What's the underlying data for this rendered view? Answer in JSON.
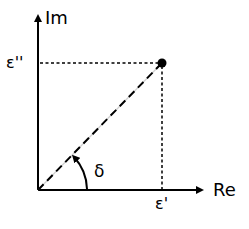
{
  "diagram": {
    "type": "complex-plane-phasor",
    "axes": {
      "x_label": "Re",
      "y_label": "Im"
    },
    "ticks": {
      "x_tick_label": "ε'",
      "y_tick_label": "ε''"
    },
    "angle": {
      "label": "δ"
    },
    "point": {
      "description": "complex permittivity point (ε', ε'')"
    },
    "colors": {
      "stroke": "#000000",
      "background": "#ffffff",
      "dash_gap": "#d0d0d0"
    }
  }
}
